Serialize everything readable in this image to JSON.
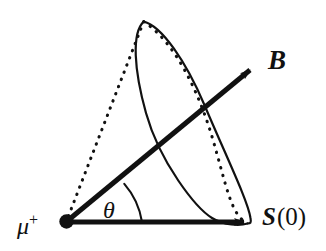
{
  "figure": {
    "background_color": "#ffffff",
    "ink_color": "#111111",
    "width": 326,
    "height": 251
  },
  "labels": {
    "magnetic_field": "B",
    "spin_symbol": "S",
    "spin_argument": "(0)",
    "angle": "θ",
    "particle_symbol": "μ",
    "particle_charge": "+"
  },
  "geometry": {
    "apex": {
      "x": 66,
      "y": 222
    },
    "apex_dot_radius": 6.5,
    "spin_vector": {
      "from": {
        "x": 66,
        "y": 222
      },
      "to": {
        "x": 247,
        "y": 222
      },
      "arrow": "solid",
      "label": "S(0)"
    },
    "field_vector": {
      "from": {
        "x": 66,
        "y": 222
      },
      "to": {
        "x": 252,
        "y": 69
      },
      "arrow": "solid",
      "label": "B"
    },
    "cone_hidden_edge": {
      "from": {
        "x": 66,
        "y": 222
      },
      "to": {
        "x": 144,
        "y": 21
      },
      "style": "dotted"
    },
    "precession_ellipse": {
      "center": {
        "x": 196,
        "y": 121
      },
      "semi_major": 115,
      "semi_minor": 27,
      "rotation_deg": 62,
      "front_style": "solid",
      "back_style": "dotted"
    },
    "angle_arc": {
      "vertex": {
        "x": 66,
        "y": 222
      },
      "radius": 76,
      "from_deg": 0,
      "to_deg": 40,
      "style": "solid"
    }
  }
}
